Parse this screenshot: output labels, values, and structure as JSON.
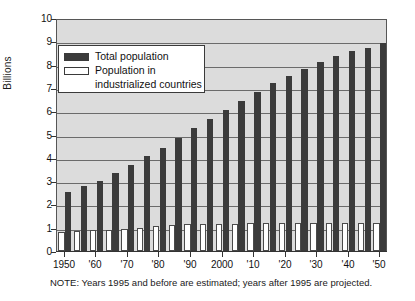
{
  "chart_data": {
    "type": "bar",
    "title": "",
    "subtitle": "",
    "xlabel": "",
    "ylabel": "Billions",
    "ylim": [
      0,
      10
    ],
    "ytick_values": [
      0,
      1,
      2,
      3,
      4,
      5,
      6,
      7,
      8,
      9,
      10
    ],
    "ytick_labels": [
      "0",
      "1",
      "2",
      "3",
      "4",
      "5",
      "6",
      "7",
      "8",
      "9",
      "10"
    ],
    "grid": true,
    "grid_axis": "y",
    "legend_position": "upper-left-inside",
    "x": [
      1950,
      1955,
      1960,
      1965,
      1970,
      1975,
      1980,
      1985,
      1990,
      1995,
      2000,
      2005,
      2010,
      2015,
      2020,
      2025,
      2030,
      2035,
      2040,
      2045,
      2050
    ],
    "xtick_values": [
      1950,
      1960,
      1970,
      1980,
      1990,
      2000,
      2010,
      2020,
      2030,
      2040,
      2050
    ],
    "xtick_labels": [
      "1950",
      "'60",
      "'70",
      "'80",
      "'90",
      "2000",
      "'10",
      "'20",
      "'30",
      "'40",
      "'50"
    ],
    "series": [
      {
        "name": "Total population",
        "color": "#3b3b3b",
        "values": [
          2.52,
          2.77,
          3.02,
          3.34,
          3.69,
          4.07,
          4.43,
          4.83,
          5.26,
          5.67,
          6.06,
          6.45,
          6.83,
          7.2,
          7.5,
          7.81,
          8.11,
          8.37,
          8.58,
          8.73,
          8.91
        ]
      },
      {
        "name": "Population in industrialized countries",
        "color": "#ffffff",
        "values": [
          0.81,
          0.86,
          0.9,
          0.92,
          0.96,
          1.0,
          1.08,
          1.11,
          1.14,
          1.15,
          1.17,
          1.18,
          1.19,
          1.2,
          1.2,
          1.21,
          1.21,
          1.2,
          1.2,
          1.19,
          1.19
        ]
      }
    ],
    "annotations": [
      "NOTE: Years 1995 and before are estimated; years after 1995 are projected."
    ]
  },
  "legend": {
    "entries": [
      {
        "label": "Total population",
        "label_line2": "",
        "swatch": "filled-dark"
      },
      {
        "label": "Population in",
        "label_line2": "industrialized countries",
        "swatch": "outlined-white"
      }
    ]
  },
  "note": {
    "text": "NOTE: Years 1995 and before are estimated; years after 1995 are projected."
  },
  "colors": {
    "plot_background": "#dcdcdc",
    "gridline": "#6b6b6b",
    "axis": "#333333",
    "bar_total": "#3b3b3b",
    "bar_industrial": "#ffffff",
    "page_background": "#ffffff"
  }
}
